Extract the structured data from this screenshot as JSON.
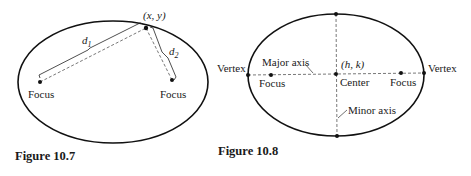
{
  "figures": [
    {
      "id": "fig-10-7",
      "caption": "Figure 10.7",
      "labels": {
        "point": "(x, y)",
        "d1": "d",
        "d1_sub": "1",
        "d2": "d",
        "d2_sub": "2",
        "focus_left": "Focus",
        "focus_right": "Focus"
      }
    },
    {
      "id": "fig-10-8",
      "caption": "Figure 10.8",
      "labels": {
        "vertex_left": "Vertex",
        "vertex_right": "Vertex",
        "major_axis": "Major axis",
        "minor_axis": "Minor axis",
        "center_coords": "(h, k)",
        "center": "Center",
        "focus_left": "Focus",
        "focus_right": "Focus"
      }
    }
  ]
}
